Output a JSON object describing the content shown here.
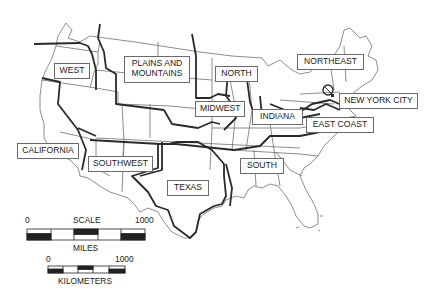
{
  "map": {
    "type": "regional map of the United States",
    "colors": {
      "background": "#ffffff",
      "lines": "#3a3a3a",
      "labels_border": "#6a6a6a",
      "text": "#222222"
    },
    "regions": [
      {
        "label": "WEST"
      },
      {
        "label": "PLAINS AND",
        "label2": "MOUNTAINS"
      },
      {
        "label": "NORTH"
      },
      {
        "label": "NORTHEAST"
      },
      {
        "label": "NEW YORK CITY"
      },
      {
        "label": "MIDWEST"
      },
      {
        "label": "INDIANA"
      },
      {
        "label": "EAST COAST"
      },
      {
        "label": "CALIFORNIA"
      },
      {
        "label": "SOUTHWEST"
      },
      {
        "label": "TEXAS"
      },
      {
        "label": "SOUTH"
      }
    ]
  },
  "scale": {
    "title": "SCALE",
    "miles": {
      "start": "0",
      "end": "1000",
      "unit": "MILES"
    },
    "kilometers": {
      "start": "0",
      "end": "1000",
      "unit": "KILOMETERS"
    }
  }
}
